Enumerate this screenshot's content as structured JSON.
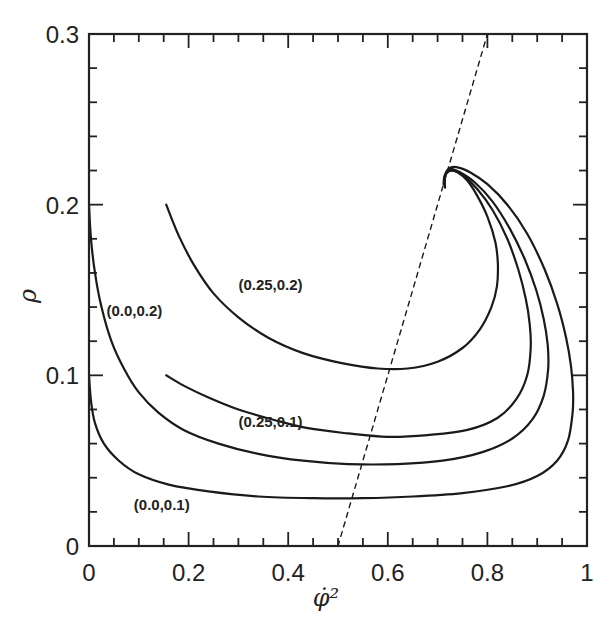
{
  "chart_data": {
    "type": "line",
    "title": "",
    "xlabel": "φ̇²",
    "ylabel": "ρ",
    "xlim": [
      0,
      1
    ],
    "ylim": [
      0,
      0.3
    ],
    "grid": false,
    "legend": "none (curves labeled inline)",
    "x_ticks": [
      {
        "value": 0,
        "label": "0"
      },
      {
        "value": 0.2,
        "label": "0.2"
      },
      {
        "value": 0.4,
        "label": "0.4"
      },
      {
        "value": 0.6,
        "label": "0.6"
      },
      {
        "value": 0.8,
        "label": "0.8"
      },
      {
        "value": 1,
        "label": "1"
      }
    ],
    "y_ticks": [
      {
        "value": 0,
        "label": "0"
      },
      {
        "value": 0.1,
        "label": "0.1"
      },
      {
        "value": 0.2,
        "label": "0.2"
      },
      {
        "value": 0.3,
        "label": "0.3"
      }
    ],
    "x_minor_step": 0.05,
    "y_minor_step": 0.02,
    "series": [
      {
        "name": "(0.0,0.1)",
        "style": "solid",
        "label_pos": [
          0.09,
          0.021
        ],
        "points": [
          [
            0.0,
            0.1
          ],
          [
            0.004,
            0.085
          ],
          [
            0.012,
            0.072
          ],
          [
            0.03,
            0.06
          ],
          [
            0.06,
            0.05
          ],
          [
            0.1,
            0.042
          ],
          [
            0.16,
            0.036
          ],
          [
            0.24,
            0.032
          ],
          [
            0.34,
            0.029
          ],
          [
            0.45,
            0.028
          ],
          [
            0.55,
            0.028
          ],
          [
            0.65,
            0.029
          ],
          [
            0.75,
            0.031
          ],
          [
            0.84,
            0.035
          ],
          [
            0.9,
            0.041
          ],
          [
            0.94,
            0.05
          ],
          [
            0.962,
            0.062
          ],
          [
            0.971,
            0.078
          ],
          [
            0.972,
            0.09
          ],
          [
            0.968,
            0.105
          ],
          [
            0.958,
            0.122
          ],
          [
            0.94,
            0.142
          ],
          [
            0.915,
            0.162
          ],
          [
            0.88,
            0.183
          ],
          [
            0.84,
            0.2
          ],
          [
            0.8,
            0.212
          ],
          [
            0.765,
            0.219
          ],
          [
            0.738,
            0.222
          ],
          [
            0.722,
            0.221
          ],
          [
            0.714,
            0.216
          ],
          [
            0.715,
            0.21
          ]
        ]
      },
      {
        "name": "(0.0,0.2)",
        "style": "solid",
        "label_pos": [
          0.035,
          0.135
        ],
        "points": [
          [
            0.0,
            0.2
          ],
          [
            0.004,
            0.18
          ],
          [
            0.012,
            0.16
          ],
          [
            0.025,
            0.14
          ],
          [
            0.045,
            0.12
          ],
          [
            0.07,
            0.104
          ],
          [
            0.1,
            0.09
          ],
          [
            0.14,
            0.078
          ],
          [
            0.19,
            0.068
          ],
          [
            0.26,
            0.06
          ],
          [
            0.34,
            0.054
          ],
          [
            0.43,
            0.05
          ],
          [
            0.52,
            0.048
          ],
          [
            0.62,
            0.048
          ],
          [
            0.71,
            0.05
          ],
          [
            0.79,
            0.055
          ],
          [
            0.85,
            0.063
          ],
          [
            0.89,
            0.074
          ],
          [
            0.913,
            0.088
          ],
          [
            0.922,
            0.104
          ],
          [
            0.921,
            0.118
          ],
          [
            0.913,
            0.133
          ],
          [
            0.898,
            0.15
          ],
          [
            0.875,
            0.168
          ],
          [
            0.845,
            0.186
          ],
          [
            0.81,
            0.202
          ],
          [
            0.775,
            0.213
          ],
          [
            0.745,
            0.219
          ],
          [
            0.726,
            0.221
          ],
          [
            0.716,
            0.218
          ],
          [
            0.714,
            0.212
          ]
        ]
      },
      {
        "name": "(0.25,0.1)",
        "style": "solid",
        "label_pos": [
          0.3,
          0.07
        ],
        "points": [
          [
            0.155,
            0.1
          ],
          [
            0.19,
            0.094
          ],
          [
            0.24,
            0.087
          ],
          [
            0.3,
            0.08
          ],
          [
            0.37,
            0.074
          ],
          [
            0.44,
            0.069
          ],
          [
            0.52,
            0.066
          ],
          [
            0.6,
            0.064
          ],
          [
            0.68,
            0.065
          ],
          [
            0.76,
            0.068
          ],
          [
            0.82,
            0.075
          ],
          [
            0.858,
            0.086
          ],
          [
            0.88,
            0.1
          ],
          [
            0.887,
            0.116
          ],
          [
            0.885,
            0.13
          ],
          [
            0.877,
            0.145
          ],
          [
            0.862,
            0.162
          ],
          [
            0.84,
            0.18
          ],
          [
            0.81,
            0.197
          ],
          [
            0.78,
            0.209
          ],
          [
            0.752,
            0.217
          ],
          [
            0.73,
            0.22
          ],
          [
            0.717,
            0.218
          ],
          [
            0.713,
            0.213
          ]
        ]
      },
      {
        "name": "(0.25,0.2)",
        "style": "solid",
        "label_pos": [
          0.3,
          0.15
        ],
        "points": [
          [
            0.155,
            0.2
          ],
          [
            0.18,
            0.182
          ],
          [
            0.21,
            0.165
          ],
          [
            0.25,
            0.148
          ],
          [
            0.3,
            0.134
          ],
          [
            0.36,
            0.122
          ],
          [
            0.43,
            0.113
          ],
          [
            0.51,
            0.107
          ],
          [
            0.58,
            0.104
          ],
          [
            0.64,
            0.104
          ],
          [
            0.7,
            0.108
          ],
          [
            0.75,
            0.116
          ],
          [
            0.785,
            0.127
          ],
          [
            0.808,
            0.14
          ],
          [
            0.819,
            0.152
          ],
          [
            0.821,
            0.165
          ],
          [
            0.816,
            0.178
          ],
          [
            0.8,
            0.193
          ],
          [
            0.78,
            0.205
          ],
          [
            0.76,
            0.214
          ],
          [
            0.74,
            0.219
          ],
          [
            0.724,
            0.22
          ],
          [
            0.714,
            0.217
          ],
          [
            0.712,
            0.212
          ]
        ]
      },
      {
        "name": "reference line",
        "style": "dashed",
        "points": [
          [
            0.5,
            0.0
          ],
          [
            0.8,
            0.3
          ]
        ]
      }
    ]
  },
  "labels": {
    "xlabel": "φ̇²",
    "ylabel": "ρ"
  }
}
